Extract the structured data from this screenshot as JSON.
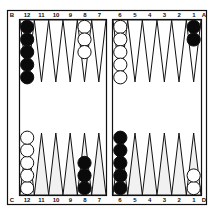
{
  "board": {
    "colors": {
      "background": "#ffffff",
      "line": "#111111",
      "black_checker": "#0a0a0a",
      "white_checker": "#ffffff",
      "point_fill_light": "#f1f1f1"
    },
    "corner_labels": {
      "top_left": "B",
      "top_right": "A",
      "bottom_left": "C",
      "bottom_right": "D"
    },
    "top_labels": {
      "left": [
        "12",
        "11",
        "10",
        "9",
        "8",
        "7"
      ],
      "right": [
        "6",
        "5",
        "4",
        "3",
        "2",
        "1"
      ]
    },
    "bottom_labels": {
      "left": [
        "12",
        "11",
        "10",
        "9",
        "8",
        "7"
      ],
      "right": [
        "6",
        "5",
        "4",
        "3",
        "2",
        "1"
      ]
    },
    "checkers": {
      "top": [
        {
          "point": "12",
          "half": "left",
          "color": "black",
          "count": 5
        },
        {
          "point": "8",
          "half": "left",
          "color": "white",
          "count": 3
        },
        {
          "point": "6",
          "half": "right",
          "color": "white",
          "count": 5
        },
        {
          "point": "1",
          "half": "right",
          "color": "black",
          "count": 2
        }
      ],
      "bottom": [
        {
          "point": "12",
          "half": "left",
          "color": "white",
          "count": 5
        },
        {
          "point": "8",
          "half": "left",
          "color": "black",
          "count": 3
        },
        {
          "point": "6",
          "half": "right",
          "color": "black",
          "count": 5
        },
        {
          "point": "1",
          "half": "right",
          "color": "white",
          "count": 2
        }
      ]
    }
  }
}
